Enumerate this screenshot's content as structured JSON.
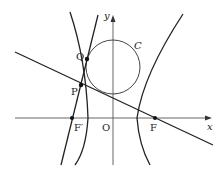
{
  "diagram": {
    "labels": {
      "x_axis": "x",
      "y_axis": "y",
      "origin": "O",
      "circle": "C",
      "point_P": "P",
      "point_Q": "Q",
      "focus_left": "F′",
      "focus_right": "F"
    },
    "colors": {
      "stroke": "#222222",
      "thin_stroke": "#555555",
      "background": "#ffffff"
    }
  }
}
